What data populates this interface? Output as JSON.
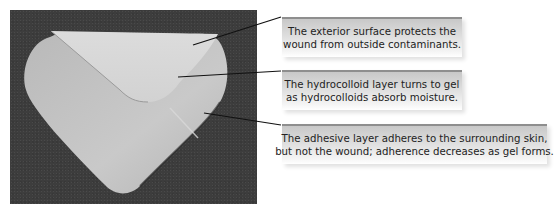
{
  "figure": {
    "callouts": [
      {
        "id": "exterior-surface",
        "lines": [
          "The exterior surface protects the",
          "wound from outside contaminants."
        ]
      },
      {
        "id": "hydrocolloid-layer",
        "lines": [
          "The hydrocolloid layer turns to gel",
          "as hydrocolloids absorb moisture."
        ]
      },
      {
        "id": "adhesive-layer",
        "lines": [
          "The adhesive layer adheres to the surrounding skin,",
          "but not the wound; adherence decreases as gel forms."
        ]
      }
    ]
  }
}
